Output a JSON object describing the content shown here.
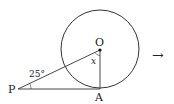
{
  "diagram": {
    "points": {
      "O": "O",
      "P": "P",
      "A": "A"
    },
    "angle_p": "25°",
    "angle_o": "x",
    "arrow": "→"
  }
}
